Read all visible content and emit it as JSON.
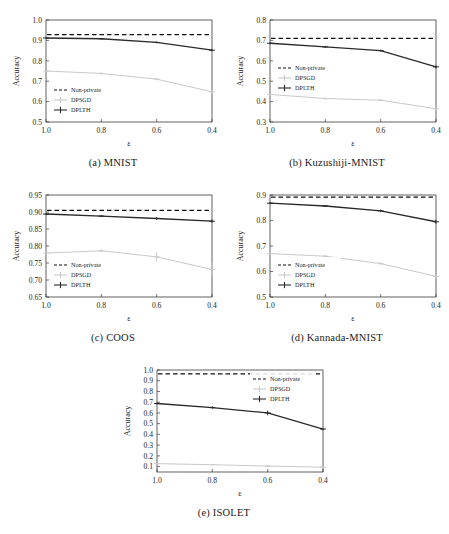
{
  "figure": {
    "xlabel": "ε",
    "ylabel": "Accuracy",
    "x_ticks": [
      "1.0",
      "0.8",
      "0.6",
      "0.4"
    ],
    "legend": {
      "nonprivate": "Non-private",
      "dpsgd": "DPSGD",
      "dplth": "DPLTH"
    },
    "colors": {
      "dplth": "#2a2a2a",
      "dpsgd": "#c9c9c9",
      "nonprivate": "#111111",
      "axis": "#3b3b3b",
      "background": "#ffffff"
    }
  },
  "captions": {
    "a": "(a) MNIST",
    "b": "(b) Kuzushiji-MNIST",
    "c": "(c) COOS",
    "d": "(d) Kannada-MNIST",
    "e": "(e) ISOLET"
  },
  "chart_data": [
    {
      "type": "line",
      "panel": "a",
      "title": "(a) MNIST",
      "xlabel": "ε",
      "ylabel": "Accuracy",
      "x": [
        1.0,
        0.8,
        0.6,
        0.4
      ],
      "xlim": [
        1.0,
        0.4
      ],
      "ylim": [
        0.5,
        1.0
      ],
      "yticks": [
        0.5,
        0.6,
        0.7,
        0.8,
        0.9,
        1.0
      ],
      "ytick_labels": [
        "0.5",
        "0.6",
        "0.7",
        "0.8",
        "0.9",
        "1.0"
      ],
      "grid": false,
      "legend_position": "lower left",
      "hline": {
        "name": "Non-private",
        "value": 0.928,
        "style": "dashed"
      },
      "series": [
        {
          "name": "DPLTH",
          "values": [
            0.912,
            0.908,
            0.89,
            0.852
          ],
          "errors": [
            0.004,
            0.004,
            0.004,
            0.006
          ],
          "color": "#2a2a2a"
        },
        {
          "name": "DPSGD",
          "values": [
            0.75,
            0.738,
            0.71,
            0.648
          ],
          "errors": [
            0.005,
            0.005,
            0.006,
            0.009
          ],
          "color": "#c9c9c9"
        }
      ]
    },
    {
      "type": "line",
      "panel": "b",
      "title": "(b) Kuzushiji-MNIST",
      "xlabel": "ε",
      "ylabel": "Accuracy",
      "x": [
        1.0,
        0.8,
        0.6,
        0.4
      ],
      "xlim": [
        1.0,
        0.4
      ],
      "ylim": [
        0.3,
        0.8
      ],
      "yticks": [
        0.3,
        0.4,
        0.5,
        0.6,
        0.7,
        0.8
      ],
      "ytick_labels": [
        "0.3",
        "0.4",
        "0.5",
        "0.6",
        "0.7",
        "0.8"
      ],
      "grid": false,
      "legend_position": "center left",
      "hline": {
        "name": "Non-private",
        "value": 0.71,
        "style": "dashed"
      },
      "series": [
        {
          "name": "DPLTH",
          "values": [
            0.686,
            0.668,
            0.65,
            0.57
          ],
          "errors": [
            0.005,
            0.005,
            0.005,
            0.008
          ],
          "color": "#2a2a2a"
        },
        {
          "name": "DPSGD",
          "values": [
            0.435,
            0.415,
            0.407,
            0.365
          ],
          "errors": [
            0.006,
            0.006,
            0.006,
            0.009
          ],
          "color": "#c9c9c9"
        }
      ]
    },
    {
      "type": "line",
      "panel": "c",
      "title": "(c) COOS",
      "xlabel": "ε",
      "ylabel": "Accuracy",
      "x": [
        1.0,
        0.8,
        0.6,
        0.4
      ],
      "xlim": [
        1.0,
        0.4
      ],
      "ylim": [
        0.65,
        0.95
      ],
      "yticks": [
        0.65,
        0.7,
        0.75,
        0.8,
        0.85,
        0.9,
        0.95
      ],
      "ytick_labels": [
        "0.65",
        "0.70",
        "0.75",
        "0.80",
        "0.85",
        "0.90",
        "0.95"
      ],
      "grid": false,
      "legend_position": "lower left",
      "hline": {
        "name": "Non-private",
        "value": 0.905,
        "style": "dashed"
      },
      "series": [
        {
          "name": "DPLTH",
          "values": [
            0.894,
            0.888,
            0.881,
            0.873
          ],
          "errors": [
            0.003,
            0.003,
            0.004,
            0.005
          ],
          "color": "#2a2a2a"
        },
        {
          "name": "DPSGD",
          "values": [
            0.779,
            0.786,
            0.768,
            0.731
          ],
          "errors": [
            0.006,
            0.005,
            0.014,
            0.018
          ],
          "color": "#c9c9c9"
        }
      ]
    },
    {
      "type": "line",
      "panel": "d",
      "title": "(d) Kannada-MNIST",
      "xlabel": "ε",
      "ylabel": "Accuracy",
      "x": [
        1.0,
        0.8,
        0.6,
        0.4
      ],
      "xlim": [
        1.0,
        0.4
      ],
      "ylim": [
        0.5,
        0.9
      ],
      "yticks": [
        0.5,
        0.6,
        0.7,
        0.8,
        0.9
      ],
      "ytick_labels": [
        "0.5",
        "0.6",
        "0.7",
        "0.8",
        "0.9"
      ],
      "grid": false,
      "legend_position": "lower left",
      "hline": {
        "name": "Non-private",
        "value": 0.892,
        "style": "dashed"
      },
      "series": [
        {
          "name": "DPLTH",
          "values": [
            0.868,
            0.857,
            0.838,
            0.795
          ],
          "errors": [
            0.004,
            0.004,
            0.005,
            0.008
          ],
          "color": "#2a2a2a"
        },
        {
          "name": "DPSGD",
          "values": [
            0.67,
            0.66,
            0.631,
            0.581
          ],
          "errors": [
            0.006,
            0.006,
            0.007,
            0.01
          ],
          "color": "#c9c9c9"
        }
      ]
    },
    {
      "type": "line",
      "panel": "e",
      "title": "(e) ISOLET",
      "xlabel": "ε",
      "ylabel": "Accuracy",
      "x": [
        1.0,
        0.8,
        0.6,
        0.4
      ],
      "xlim": [
        1.0,
        0.4
      ],
      "ylim": [
        0.05,
        1.0
      ],
      "yticks": [
        0.1,
        0.2,
        0.3,
        0.4,
        0.5,
        0.6,
        0.7,
        0.8,
        0.9,
        1.0
      ],
      "ytick_labels": [
        "0.1",
        "0.2",
        "0.3",
        "0.4",
        "0.5",
        "0.6",
        "0.7",
        "0.8",
        "0.9",
        "1.0"
      ],
      "grid": false,
      "legend_position": "upper right",
      "hline": {
        "name": "Non-private",
        "value": 0.965,
        "style": "dashed"
      },
      "series": [
        {
          "name": "DPLTH",
          "values": [
            0.688,
            0.65,
            0.6,
            0.45
          ],
          "errors": [
            0.01,
            0.012,
            0.022,
            0.012
          ],
          "color": "#2a2a2a"
        },
        {
          "name": "DPSGD",
          "values": [
            0.128,
            0.118,
            0.105,
            0.095
          ],
          "errors": [
            0.006,
            0.006,
            0.005,
            0.005
          ],
          "color": "#c9c9c9"
        }
      ]
    }
  ]
}
